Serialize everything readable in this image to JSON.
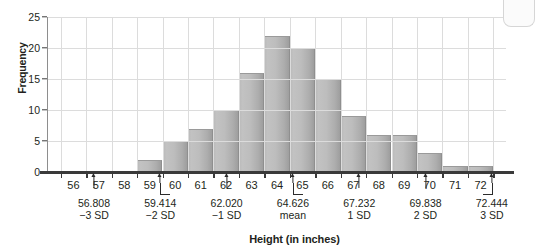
{
  "chart_data": {
    "type": "bar",
    "title": "",
    "xlabel": "Height (in inches)",
    "ylabel": "Frequency",
    "xlim": [
      55,
      73
    ],
    "ylim": [
      0,
      25
    ],
    "grid": true,
    "legend": "none",
    "categories": [
      "56",
      "57",
      "58",
      "59",
      "60",
      "61",
      "62",
      "63",
      "64",
      "65",
      "66",
      "67",
      "68",
      "69",
      "70",
      "71",
      "72"
    ],
    "values": [
      0,
      0,
      0,
      2,
      5,
      7,
      10,
      16,
      22,
      20,
      15,
      9,
      6,
      6,
      3,
      1,
      1
    ],
    "x_tick_labels": [
      "56",
      "57",
      "58",
      "59",
      "60",
      "61",
      "62",
      "63",
      "64",
      "65",
      "66",
      "67",
      "68",
      "69",
      "70",
      "71",
      "72"
    ],
    "y_tick_labels": [
      "0",
      "5",
      "10",
      "15",
      "20",
      "25"
    ],
    "y_tick_values": [
      0,
      5,
      10,
      15,
      20,
      25
    ],
    "annotations": [
      {
        "id": "minus-3-sd",
        "x": 56.808,
        "value_label": "56.808",
        "sd_label": "−3 SD",
        "marker": "arrow"
      },
      {
        "id": "minus-2-sd",
        "x": 59.414,
        "value_label": "59.414",
        "sd_label": "−2 SD",
        "marker": "bracket-left"
      },
      {
        "id": "minus-1-sd",
        "x": 62.02,
        "value_label": "62.020",
        "sd_label": "−1 SD",
        "marker": "arrow"
      },
      {
        "id": "mean",
        "x": 64.626,
        "value_label": "64.626",
        "sd_label": "mean",
        "marker": "bracket-left"
      },
      {
        "id": "plus-1-sd",
        "x": 67.232,
        "value_label": "67.232",
        "sd_label": "1 SD",
        "marker": "arrow"
      },
      {
        "id": "plus-2-sd",
        "x": 69.838,
        "value_label": "69.838",
        "sd_label": "2 SD",
        "marker": "arrow"
      },
      {
        "id": "plus-3-sd",
        "x": 72.444,
        "value_label": "72.444",
        "sd_label": "3 SD",
        "marker": "bracket-right"
      }
    ]
  }
}
